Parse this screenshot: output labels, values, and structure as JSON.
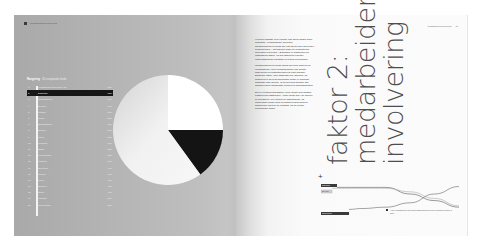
{
  "spread": {
    "left_page": {
      "header": {
        "running_title": "Medarbejderinvolvering"
      },
      "list": {
        "title_bold": "Rangering",
        "title_rest": "· 20 europæiske lande",
        "rows": [
          {
            "num": "1",
            "label": "Medarbejderinvolvering i alt",
            "value": "57%",
            "highlight": false
          },
          {
            "num": "2",
            "label": "Danmark",
            "value": "63%",
            "highlight": true
          },
          {
            "num": "3",
            "label": "Nederlandene",
            "value": "61%",
            "highlight": false
          },
          {
            "num": "4",
            "label": "Sverige",
            "value": "60%",
            "highlight": false
          },
          {
            "num": "5",
            "label": "Finland",
            "value": "59%",
            "highlight": false
          },
          {
            "num": "6",
            "label": "Norge",
            "value": "58%",
            "highlight": false
          },
          {
            "num": "7",
            "label": "Storbritannien",
            "value": "57%",
            "highlight": false
          },
          {
            "num": "8",
            "label": "Belgien",
            "value": "56%",
            "highlight": false
          },
          {
            "num": "9",
            "label": "Irland",
            "value": "55%",
            "highlight": false
          },
          {
            "num": "10",
            "label": "Tyskland",
            "value": "54%",
            "highlight": false
          },
          {
            "num": "11",
            "label": "Østrig",
            "value": "53%",
            "highlight": false
          },
          {
            "num": "12",
            "label": "Luxembourg",
            "value": "52%",
            "highlight": false
          },
          {
            "num": "13",
            "label": "Frankrig",
            "value": "50%",
            "highlight": false
          },
          {
            "num": "14",
            "label": "Slovenien",
            "value": "49%",
            "highlight": false
          },
          {
            "num": "15",
            "label": "Tjekkiet",
            "value": "47%",
            "highlight": false
          },
          {
            "num": "16",
            "label": "Polen",
            "value": "45%",
            "highlight": false
          },
          {
            "num": "17",
            "label": "Spanien",
            "value": "43%",
            "highlight": false
          },
          {
            "num": "18",
            "label": "Italien",
            "value": "41%",
            "highlight": false
          },
          {
            "num": "19",
            "label": "Portugal",
            "value": "39%",
            "highlight": false
          },
          {
            "num": "20",
            "label": "Grækenland",
            "value": "36%",
            "highlight": false
          }
        ]
      },
      "pie": {
        "slices": [
          {
            "name": "white",
            "percent": 25,
            "color": "#ffffff"
          },
          {
            "name": "black",
            "percent": 15,
            "color": "#141414"
          },
          {
            "name": "gray-gradient",
            "percent": 60,
            "color": "#e6e6e6"
          }
        ]
      }
    },
    "right_page": {
      "header": {
        "running_title": "Medarbejderinvolvering",
        "page_number": "17"
      },
      "body": [
        "Hverken ansatte eller ledelse kan alene skabe gode resultater. Virksomheder med stor medarbejderinvolvering har vist sig at klare sig bedre i konkurrencen – det gælder både for produktivitet, innovation og trivsel. I Danmark er traditionen for inddragelse stærk, og det afspejles tydeligt i undersøgelsens resultater på tværs af brancher.",
        "Medarbejderinvolvering måles her som andelen af virksomheder, hvor medarbejderne har direkte indflydelse på organiseringen af eget arbejde. Danmark ligger i den absolutte top i Europa, og forskellen til de sydeuropæiske lande er markant. Samtidig viser tallene, at involvering hænger tæt sammen med ledelsesstil og tillid på arbejdspladsen.",
        "Det er et åbent spørgsmål, hvor længe den danske position kan fastholdes. Andre lande har i de senere år investeret i nye former for samarbejde, og udviklingen peger mod en gradvis udjævning af forskellene mellem de nordiske og de øvrige europæiske lande."
      ],
      "title_lines": [
        "faktor 2:",
        "medarbeider-",
        "involvering"
      ],
      "plus_marker": "+",
      "chart_legend_labels": [
        "Danmark",
        "EU-snit",
        "Sydeuropa"
      ],
      "chart_note": "Andel virksomheder med høj medarbejderinvolvering, udvikling fra 2000 til 2010"
    }
  },
  "chart_data": [
    {
      "type": "pie",
      "title": "",
      "categories": [
        "Segment A (white)",
        "Segment B (black)",
        "Segment C (gray)"
      ],
      "values": [
        25,
        15,
        60
      ]
    },
    {
      "type": "line",
      "title": "",
      "x": [
        0,
        1,
        2,
        3,
        4,
        5
      ],
      "series": [
        {
          "name": "Danmark",
          "values": [
            90,
            90,
            90,
            75,
            60,
            45
          ]
        },
        {
          "name": "EU-snit",
          "values": [
            88,
            88,
            88,
            80,
            65,
            48
          ]
        },
        {
          "name": "Sydeuropa",
          "values": [
            40,
            42,
            45,
            55,
            75,
            92
          ]
        }
      ],
      "xlabel": "",
      "ylabel": "",
      "grid": false
    }
  ]
}
